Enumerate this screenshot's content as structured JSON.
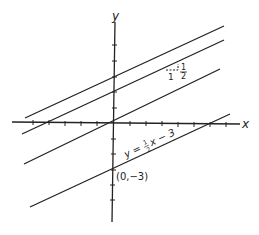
{
  "diagram": {
    "axes": {
      "x_label": "x",
      "y_label": "y"
    },
    "lines": [
      {
        "equation": "y = 1/2 x + 3",
        "intercept": 3
      },
      {
        "equation": "y = 1/2 x + 2",
        "intercept": 2
      },
      {
        "equation": "y = 1/2 x",
        "intercept": 0
      },
      {
        "equation": "y = 1/2 x - 3",
        "intercept": -3
      }
    ],
    "labels": {
      "equation_prefix": "y =",
      "equation_frac_num": "1",
      "equation_frac_den": "2",
      "equation_suffix": "x − 3",
      "point": "(0,−3)",
      "slope_run": "1",
      "slope_rise_num": "1",
      "slope_rise_den": "2"
    },
    "slope": "1/2"
  }
}
